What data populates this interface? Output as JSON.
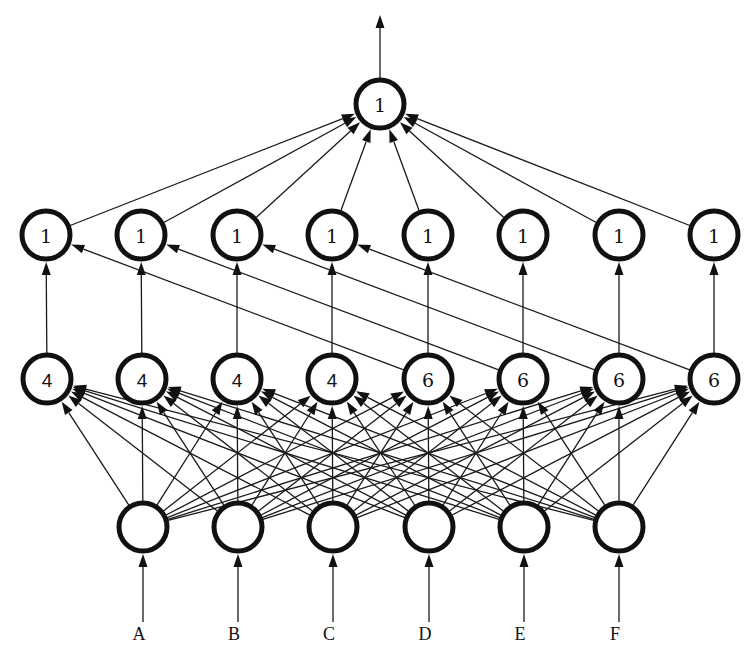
{
  "diagram": {
    "type": "feedforward-network",
    "node_radius": 26,
    "output_arrow": {
      "from_y": 78,
      "to_y": 14,
      "x": 380
    },
    "output_layer": {
      "y": 104,
      "nodes": [
        {
          "x": 380,
          "label": "1",
          "font": "serif"
        }
      ]
    },
    "layer2": {
      "y": 235,
      "nodes": [
        {
          "x": 46,
          "label": "1",
          "font": "serif"
        },
        {
          "x": 141,
          "label": "1",
          "font": "serif"
        },
        {
          "x": 237,
          "label": "1",
          "font": "serif"
        },
        {
          "x": 332,
          "label": "1",
          "font": "serif"
        },
        {
          "x": 428,
          "label": "1",
          "font": "serif"
        },
        {
          "x": 523,
          "label": "1",
          "font": "serif"
        },
        {
          "x": 619,
          "label": "1",
          "font": "serif"
        },
        {
          "x": 714,
          "label": "1",
          "font": "serif"
        }
      ]
    },
    "layer1": {
      "y": 379,
      "nodes": [
        {
          "x": 47,
          "label": "4",
          "font": "sans"
        },
        {
          "x": 142,
          "label": "4",
          "font": "sans"
        },
        {
          "x": 237,
          "label": "4",
          "font": "sans"
        },
        {
          "x": 332,
          "label": "4",
          "font": "sans"
        },
        {
          "x": 428,
          "label": "6",
          "font": "serif"
        },
        {
          "x": 523,
          "label": "6",
          "font": "serif"
        },
        {
          "x": 619,
          "label": "6",
          "font": "serif"
        },
        {
          "x": 714,
          "label": "6",
          "font": "serif"
        }
      ]
    },
    "input_layer": {
      "y": 527,
      "nodes": [
        {
          "x": 143,
          "label": ""
        },
        {
          "x": 238,
          "label": ""
        },
        {
          "x": 333,
          "label": ""
        },
        {
          "x": 429,
          "label": ""
        },
        {
          "x": 524,
          "label": ""
        },
        {
          "x": 619,
          "label": ""
        }
      ]
    },
    "inputs": {
      "line_bottom_y": 622,
      "label_y": 634,
      "labels": [
        "A",
        "B",
        "C",
        "D",
        "E",
        "F"
      ],
      "label_offset_x": -4
    },
    "edges": {
      "input_to_layer1": "all-to-all",
      "layer1_to_layer2_vertical": [
        [
          0,
          0
        ],
        [
          1,
          1
        ],
        [
          2,
          2
        ],
        [
          3,
          3
        ],
        [
          4,
          4
        ],
        [
          5,
          5
        ],
        [
          6,
          6
        ],
        [
          7,
          7
        ]
      ],
      "layer1_to_layer2_skip": [
        [
          4,
          0
        ],
        [
          5,
          1
        ],
        [
          6,
          2
        ],
        [
          7,
          3
        ]
      ],
      "layer2_to_output": "all-to-one"
    }
  }
}
